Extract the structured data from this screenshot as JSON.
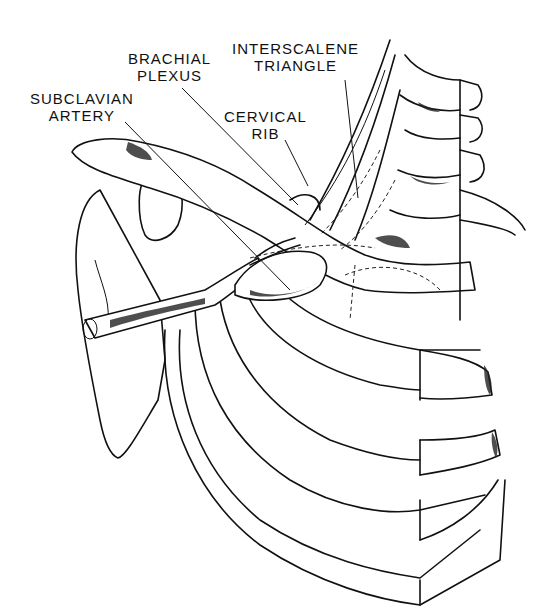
{
  "figure": {
    "labels": [
      {
        "id": "interscalene",
        "lines": [
          "INTERSCALENE",
          "TRIANGLE"
        ]
      },
      {
        "id": "brachial",
        "lines": [
          "BRACHIAL",
          "PLEXUS"
        ]
      },
      {
        "id": "subclavian",
        "lines": [
          "SUBCLAVIAN",
          "ARTERY"
        ]
      },
      {
        "id": "cervical",
        "lines": [
          "CERVICAL",
          "RIB"
        ]
      }
    ]
  },
  "colors": {
    "line": "#111111",
    "background": "#ffffff"
  }
}
